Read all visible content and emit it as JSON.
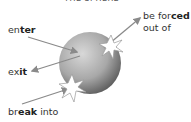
{
  "title_partial": "THE SPHERE",
  "labels": {
    "enter": {
      "pre": "en",
      "bold": "ter",
      "post": ""
    },
    "exit": {
      "pre": "ex",
      "bold": "it",
      "post": ""
    },
    "forced_line1": {
      "pre": "be for",
      "bold": "ced",
      "post": ""
    },
    "forced_line2": "out of",
    "break": {
      "pre": "br",
      "bold": "eak",
      "post": " into"
    }
  },
  "colors": {
    "arrow": "#8a8a8a",
    "sphere_light": "#d4d4d4",
    "sphere_dark": "#5a5a5a",
    "text": "#333333"
  }
}
